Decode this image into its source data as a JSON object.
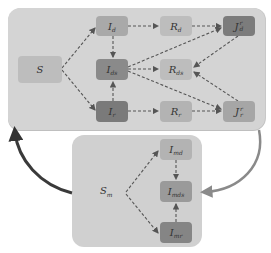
{
  "diagram": {
    "type": "compartmental-model-flow",
    "top_panel": {
      "nodes": [
        {
          "id": "S",
          "base": "S",
          "sub": "",
          "sup": "",
          "shade": "#bdbdbd"
        },
        {
          "id": "I_d",
          "base": "I",
          "sub": "d",
          "sup": "",
          "shade": "#a9a9a9"
        },
        {
          "id": "R_d",
          "base": "R",
          "sub": "d",
          "sup": "",
          "shade": "#bdbdbd"
        },
        {
          "id": "J_d^r",
          "base": "J",
          "sub": "d",
          "sup": "r",
          "shade": "#7c7c7c"
        },
        {
          "id": "I_ds",
          "base": "I",
          "sub": "ds",
          "sup": "",
          "shade": "#8a8a8a"
        },
        {
          "id": "R_ds",
          "base": "R",
          "sub": "ds",
          "sup": "",
          "shade": "#bdbdbd"
        },
        {
          "id": "I_r",
          "base": "I",
          "sub": "r",
          "sup": "",
          "shade": "#7a7a7a"
        },
        {
          "id": "R_r",
          "base": "R",
          "sub": "r",
          "sup": "",
          "shade": "#b3b3b3"
        },
        {
          "id": "J_r^r",
          "base": "J",
          "sub": "r",
          "sup": "r",
          "shade": "#a6a6a6"
        }
      ],
      "edges": [
        [
          "S",
          "I_d"
        ],
        [
          "S",
          "I_r"
        ],
        [
          "I_d",
          "R_d"
        ],
        [
          "R_d",
          "J_d^r"
        ],
        [
          "I_d",
          "I_ds"
        ],
        [
          "I_r",
          "I_ds"
        ],
        [
          "I_r",
          "R_r"
        ],
        [
          "R_r",
          "J_r^r"
        ],
        [
          "I_ds",
          "R_ds"
        ],
        [
          "I_ds",
          "J_d^r"
        ],
        [
          "I_ds",
          "J_r^r"
        ],
        [
          "J_d^r",
          "R_ds"
        ],
        [
          "J_r^r",
          "R_ds"
        ]
      ]
    },
    "bottom_panel": {
      "label": {
        "base": "S",
        "sub": "m"
      },
      "nodes": [
        {
          "id": "I_md",
          "base": "I",
          "sub": "md",
          "shade": "#b3b3b3"
        },
        {
          "id": "I_mds",
          "base": "I",
          "sub": "mds",
          "shade": "#9a9a9a"
        },
        {
          "id": "I_mr",
          "base": "I",
          "sub": "mr",
          "shade": "#858585"
        }
      ],
      "edges": [
        [
          "S_m",
          "I_md"
        ],
        [
          "S_m",
          "I_mr"
        ],
        [
          "I_md",
          "I_mds"
        ],
        [
          "I_mr",
          "I_mds"
        ]
      ]
    },
    "panel_links": [
      {
        "from": "bottom_panel",
        "to": "top_panel",
        "side": "left",
        "color": "#3a3a3a"
      },
      {
        "from": "top_panel",
        "to": "bottom_panel",
        "side": "right",
        "color": "#8a8a8a"
      }
    ]
  }
}
